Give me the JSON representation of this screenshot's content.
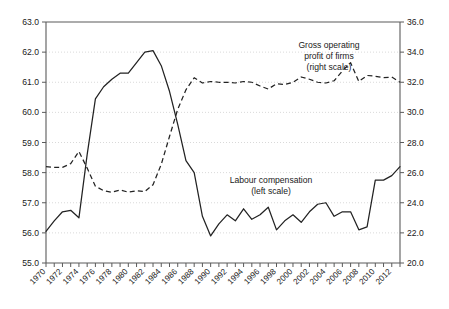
{
  "chart_data": {
    "type": "line",
    "title": "",
    "subtitle": "",
    "xlabel": "",
    "ylabel": "",
    "grid": true,
    "legend_position": "inline-annotations",
    "x": [
      1970,
      1971,
      1972,
      1973,
      1974,
      1975,
      1976,
      1977,
      1978,
      1979,
      1980,
      1981,
      1982,
      1983,
      1984,
      1985,
      1986,
      1987,
      1988,
      1989,
      1990,
      1991,
      1992,
      1993,
      1994,
      1995,
      1996,
      1997,
      1998,
      1999,
      2000,
      2001,
      2002,
      2003,
      2004,
      2005,
      2006,
      2007,
      2008,
      2009,
      2010,
      2011,
      2012,
      2013
    ],
    "xlim": [
      1970,
      2013
    ],
    "xtick_labels": [
      "1970",
      "1972",
      "1974",
      "1976",
      "1978",
      "1980",
      "1982",
      "1984",
      "1986",
      "1988",
      "1990",
      "1992",
      "1994",
      "1996",
      "1998",
      "2000",
      "2002",
      "2004",
      "2006",
      "2008",
      "2010",
      "2012"
    ],
    "xtick_values": [
      1970,
      1972,
      1974,
      1976,
      1978,
      1980,
      1982,
      1984,
      1986,
      1988,
      1990,
      1992,
      1994,
      1996,
      1998,
      2000,
      2002,
      2004,
      2006,
      2008,
      2010,
      2012
    ],
    "xtick_minor_every": 1,
    "left_axis": {
      "ylim": [
        55.0,
        63.0
      ],
      "ytick_step": 1.0,
      "ytick_labels": [
        "55.0",
        "56.0",
        "57.0",
        "58.0",
        "59.0",
        "60.0",
        "61.0",
        "62.0",
        "63.0"
      ],
      "ytick_values": [
        55.0,
        56.0,
        57.0,
        58.0,
        59.0,
        60.0,
        61.0,
        62.0,
        63.0
      ]
    },
    "right_axis": {
      "ylim": [
        20.0,
        36.0
      ],
      "ytick_step": 2.0,
      "ytick_labels": [
        "20.0",
        "22.0",
        "24.0",
        "26.0",
        "28.0",
        "30.0",
        "32.0",
        "34.0",
        "36.0"
      ],
      "ytick_values": [
        20.0,
        22.0,
        24.0,
        26.0,
        28.0,
        30.0,
        32.0,
        34.0,
        36.0
      ]
    },
    "series": [
      {
        "name": "Labour compensation",
        "axis": "left",
        "style": "solid",
        "color": "#222222",
        "annotation": {
          "line1": "Labour compensation",
          "line2": "(left scale)"
        },
        "values": [
          56.05,
          56.4,
          56.7,
          56.75,
          56.5,
          58.6,
          60.45,
          60.85,
          61.1,
          61.3,
          61.3,
          61.65,
          62.0,
          62.05,
          61.55,
          60.7,
          59.6,
          58.4,
          58.0,
          56.55,
          55.9,
          56.3,
          56.6,
          56.4,
          56.8,
          56.45,
          56.6,
          56.85,
          56.1,
          56.4,
          56.6,
          56.35,
          56.7,
          56.95,
          57.0,
          56.55,
          56.7,
          56.7,
          56.1,
          56.2,
          57.75,
          57.75,
          57.9,
          58.2
        ]
      },
      {
        "name": "Gross operating profit of firms",
        "axis": "right",
        "style": "dashed",
        "color": "#222222",
        "annotation": {
          "line1": "Gross operating",
          "line2": "profit of firms",
          "line3": "(right scale)"
        },
        "values": [
          26.4,
          26.35,
          26.35,
          26.6,
          27.4,
          26.3,
          25.1,
          24.8,
          24.7,
          24.85,
          24.7,
          24.8,
          24.75,
          25.2,
          26.55,
          28.4,
          30.2,
          31.5,
          32.3,
          31.95,
          32.05,
          32.0,
          32.0,
          31.95,
          32.05,
          32.0,
          31.75,
          31.55,
          31.9,
          31.85,
          32.0,
          32.35,
          32.2,
          32.0,
          31.95,
          32.1,
          32.75,
          33.3,
          32.05,
          32.45,
          32.4,
          32.3,
          32.35,
          32.0
        ]
      }
    ]
  },
  "annotations": {
    "gross_operating": {
      "line1": "Gross operating",
      "line2": "profit of firms",
      "line3": "(right scale)"
    },
    "labour_compensation": {
      "line1": "Labour compensation",
      "line2": "(left scale)"
    }
  }
}
